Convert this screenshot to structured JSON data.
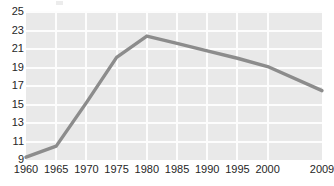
{
  "chart_data": {
    "type": "line",
    "title": "",
    "subtitle": "",
    "xlabel": "",
    "ylabel": "",
    "x": [
      1960,
      1965,
      1970,
      1975,
      1980,
      1985,
      1990,
      1995,
      2000,
      2009
    ],
    "categories": [
      "1960",
      "1965",
      "1970",
      "1975",
      "1980",
      "1985",
      "1990",
      "1995",
      "2000",
      "2009"
    ],
    "values": [
      9.3,
      10.5,
      15.2,
      20.1,
      22.4,
      21.6,
      20.8,
      20.0,
      19.1,
      16.5
    ],
    "series": [
      {
        "name": "",
        "color": "#8c8c8c",
        "values": [
          9.3,
          10.5,
          15.2,
          20.1,
          22.4,
          21.6,
          20.8,
          20.0,
          19.1,
          16.5
        ]
      }
    ],
    "xlim": [
      1960,
      2009
    ],
    "ylim": [
      9,
      25
    ],
    "ytick_labels": [
      "25",
      "23",
      "21",
      "19",
      "17",
      "15",
      "13",
      "11",
      "9"
    ],
    "ytick_values": [
      25,
      23,
      21,
      19,
      17,
      15,
      13,
      11,
      9
    ],
    "xtick_labels": [
      "1960",
      "1965",
      "1970",
      "1975",
      "1980",
      "1985",
      "1990",
      "1995",
      "2000",
      "2009"
    ],
    "grid": true,
    "grid_color": "#fdfdfd",
    "plot_background": "#e9e9e9",
    "legend": false,
    "legend_position": "none",
    "annotations": []
  },
  "colors": {
    "line": "#8c8c8c",
    "grid": "#fdfdfd",
    "plot_bg": "#e9e9e9",
    "page_bg": "#ffffff",
    "tick_text": "#262626"
  }
}
